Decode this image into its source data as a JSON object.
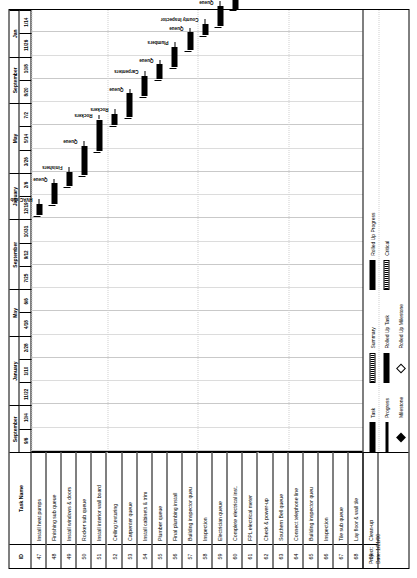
{
  "page": {
    "orientation": "landscape-rotated",
    "columns": {
      "id_header": "ID",
      "name_header": "Task Name"
    }
  },
  "timescale": {
    "months": [
      {
        "label": "September",
        "span": 2
      },
      {
        "label": "January",
        "span": 3
      },
      {
        "label": "May",
        "span": 2
      },
      {
        "label": "September",
        "span": 3
      },
      {
        "label": "January",
        "span": 2
      },
      {
        "label": "May",
        "span": 3
      },
      {
        "label": "September",
        "span": 2
      },
      {
        "label": "Jan",
        "span": 2
      }
    ],
    "days": [
      "9/6",
      "10/4",
      "11/22",
      "1/10",
      "2/28",
      "4/18",
      "6/6",
      "7/25",
      "9/12",
      "10/31",
      "12/19",
      "2/6",
      "3/26",
      "5/14",
      "7/2",
      "8/20",
      "10/8",
      "11/26",
      "1/14"
    ]
  },
  "tasks": [
    {
      "id": "47",
      "name": "Install heat pumps",
      "label": "HVAC sub",
      "start": 40.5,
      "width": 2.0,
      "kind": "task"
    },
    {
      "id": "48",
      "name": "Finishing sub queue",
      "label": "Queue",
      "start": 42.5,
      "width": 3.5,
      "kind": "task"
    },
    {
      "id": "49",
      "name": "Install windows & doors",
      "label": "Finishers",
      "start": 45.5,
      "width": 2.5,
      "kind": "task"
    },
    {
      "id": "50",
      "name": "Rocker sub queue",
      "label": "Queue",
      "start": 47.5,
      "width": 5.0,
      "kind": "task"
    },
    {
      "id": "51",
      "name": "Install interior wall board",
      "label": "Rockers",
      "start": 51.5,
      "width": 5.5,
      "kind": "task"
    },
    {
      "id": "52",
      "name": "Ceiling texturing",
      "label": "Rockers",
      "start": 56.0,
      "width": 2.0,
      "kind": "task"
    },
    {
      "id": "53",
      "name": "Carpenter queue",
      "label": "Queue",
      "start": 57.5,
      "width": 4.0,
      "kind": "task"
    },
    {
      "id": "54",
      "name": "Install cabinets & trim",
      "label": "Carpenters",
      "start": 61.0,
      "width": 3.5,
      "kind": "task"
    },
    {
      "id": "55",
      "name": "Plumber queue",
      "label": "Queue",
      "start": 64.0,
      "width": 2.5,
      "kind": "task"
    },
    {
      "id": "56",
      "name": "Final plumbing install",
      "label": "Plumbers",
      "start": 66.0,
      "width": 3.5,
      "kind": "task"
    },
    {
      "id": "57",
      "name": "Building inspector queu",
      "label": "Queue",
      "start": 69.0,
      "width": 3.0,
      "kind": "task"
    },
    {
      "id": "58",
      "name": "Inspection",
      "label": "County Inspector",
      "start": 71.5,
      "width": 2.0,
      "kind": "task"
    },
    {
      "id": "59",
      "name": "Electrician queue",
      "label": "Queue",
      "start": 73.0,
      "width": 3.5,
      "kind": "task"
    },
    {
      "id": "60",
      "name": "Complete electrical inst.",
      "label": "Electricians",
      "start": 76.0,
      "width": 3.0,
      "kind": "task"
    },
    {
      "id": "61",
      "name": "FPL electrical meter",
      "label": "FPL",
      "start": 78.5,
      "width": 2.0,
      "kind": "task"
    },
    {
      "id": "62",
      "name": "Check & power-up",
      "label": "Electrician & FPL",
      "start": 80.0,
      "width": 2.5,
      "kind": "task"
    },
    {
      "id": "63",
      "name": "Southern Bell queue",
      "label": "Queue",
      "start": 82.0,
      "width": 5.5,
      "kind": "task"
    },
    {
      "id": "64",
      "name": "Connect telephone line",
      "label": "Southern Bell",
      "start": 86.5,
      "width": 2.5,
      "kind": "task"
    },
    {
      "id": "65",
      "name": "Building inspector queu",
      "label": "Queue",
      "start": 88.5,
      "width": 3.0,
      "kind": "task"
    },
    {
      "id": "66",
      "name": "Inspection",
      "label": "County Inspector",
      "start": 91.0,
      "width": 2.0,
      "kind": "task"
    },
    {
      "id": "67",
      "name": "Tile sub queue",
      "label": "Queue",
      "start": 92.5,
      "width": 3.5,
      "kind": "task"
    },
    {
      "id": "68",
      "name": "Lay floor & wall tile",
      "label": "Tile sub",
      "start": 95.5,
      "width": 4.0,
      "kind": "task"
    },
    {
      "id": "69",
      "name": "Clean-up",
      "label": "P&D",
      "start": 99.0,
      "width": 2.0,
      "kind": "task"
    }
  ],
  "legend": {
    "column_a": [
      {
        "name": "Task",
        "swatch": "task"
      },
      {
        "name": "Progress",
        "swatch": "prog"
      },
      {
        "name": "Milestone",
        "swatch": "mile"
      }
    ],
    "column_b": [
      {
        "name": "Summary",
        "swatch": "summ"
      },
      {
        "name": "Rolled Up Task",
        "swatch": "rtask"
      },
      {
        "name": "Rolled Up Milestone",
        "swatch": "rmile"
      }
    ],
    "column_c": [
      {
        "name": "Rolled Up Progress",
        "swatch": "rprog"
      },
      {
        "name": "Critical",
        "swatch": "crit"
      }
    ]
  },
  "footer": {
    "project_label": "Project:",
    "date_label": "Date: 1/21/00"
  }
}
